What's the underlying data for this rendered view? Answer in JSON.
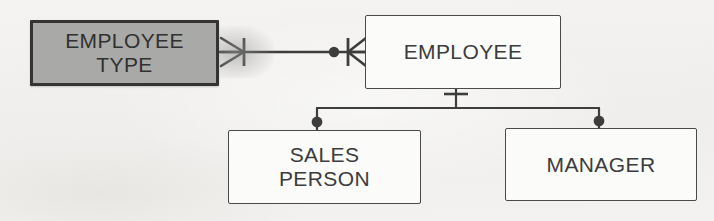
{
  "diagram": {
    "notation": "crow's foot",
    "background_color": "#f2f1ef",
    "line_color": "#3d3d3d",
    "shaded_fill_color": "#a9a9a7",
    "plain_fill_color": "#fbfbfa",
    "text_color": "#3c3c3c"
  },
  "entities": {
    "employee_type": {
      "label_line1": "EMPLOYEE",
      "label_line2": "TYPE",
      "style": "shaded"
    },
    "employee": {
      "label_line1": "EMPLOYEE",
      "style": "plain"
    },
    "sales_person": {
      "label_line1": "SALES",
      "label_line2": "PERSON",
      "style": "plain"
    },
    "manager": {
      "label_line1": "MANAGER",
      "style": "plain"
    }
  },
  "relationships": [
    {
      "name": "employee-type-to-employee",
      "from": "employee_type",
      "to": "employee",
      "from_marker": "one-mandatory-crowsfoot",
      "to_marker": "zero-or-many"
    },
    {
      "name": "employee-to-sales-person",
      "from": "employee",
      "to": "sales_person",
      "from_marker": "one-and-only-one",
      "to_marker": "optional-zero"
    },
    {
      "name": "employee-to-manager",
      "from": "employee",
      "to": "manager",
      "from_marker": "one-and-only-one",
      "to_marker": "optional-zero"
    }
  ]
}
